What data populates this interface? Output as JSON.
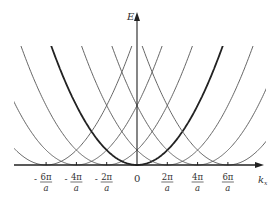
{
  "diagram": {
    "y_axis_label": "E",
    "x_axis_label": "k",
    "x_axis_subscript": "x",
    "origin_label": "0",
    "tick_labels": [
      {
        "num": "6π",
        "den": "a",
        "sign": "-",
        "k": -3
      },
      {
        "num": "4π",
        "den": "a",
        "sign": "-",
        "k": -2
      },
      {
        "num": "2π",
        "den": "a",
        "sign": "-",
        "k": -1
      },
      {
        "num": "2π",
        "den": "a",
        "sign": "",
        "k": 1
      },
      {
        "num": "4π",
        "den": "a",
        "sign": "",
        "k": 2
      },
      {
        "num": "6π",
        "den": "a",
        "sign": "",
        "k": 3
      }
    ],
    "parabola_centers_in_units_of_2pi_over_a": [
      -3,
      -2,
      -1,
      0,
      1,
      2,
      3
    ],
    "bold_parabola_center": 0,
    "colors": {
      "curve": "#555555",
      "bold_curve": "#222222",
      "axis": "#222222"
    }
  }
}
